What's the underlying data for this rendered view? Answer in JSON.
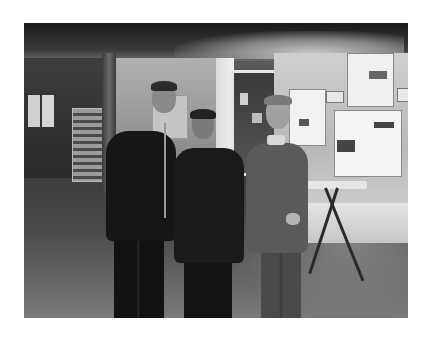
{
  "image": {
    "kind": "photograph",
    "color_mode": "grayscale",
    "description": "Three people posing together indoors in an exhibition hallway with posters on the walls and a folding table",
    "people_count": 3,
    "frame": {
      "left": 24,
      "top": 23,
      "width": 384,
      "height": 295
    }
  },
  "colors": {
    "page_background": "#ffffff",
    "ceiling": "#1a1a1a",
    "wall_right": "#c4c4c4",
    "floor": "#4a4a4a",
    "posters": "#f2f2f2"
  }
}
